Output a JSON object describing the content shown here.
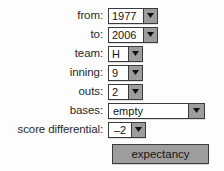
{
  "form": {
    "rows": [
      {
        "label": "from:",
        "name": "from",
        "value": "1977",
        "widget": "select",
        "arrow_icon": "chevron-down-icon"
      },
      {
        "label": "to:",
        "name": "to",
        "value": "2006",
        "widget": "select",
        "arrow_icon": "chevron-down-icon"
      },
      {
        "label": "team:",
        "name": "team",
        "value": "H",
        "widget": "select",
        "arrow_icon": "chevron-down-icon"
      },
      {
        "label": "inning:",
        "name": "inning",
        "value": "9",
        "widget": "select",
        "arrow_icon": "chevron-down-icon"
      },
      {
        "label": "outs:",
        "name": "outs",
        "value": "2",
        "widget": "select",
        "arrow_icon": "chevron-down-icon"
      },
      {
        "label": "bases:",
        "name": "bases",
        "value": "empty",
        "widget": "select",
        "arrow_icon": "chevron-down-icon"
      },
      {
        "label": "score differential:",
        "name": "score-differential",
        "value": "–2",
        "widget": "select",
        "arrow_icon": "chevron-down-icon"
      }
    ],
    "submit_button": {
      "label": "expectancy"
    }
  },
  "colors": {
    "page_background": "#fdfdfd",
    "control_face": "#9d9d9d",
    "control_border": "#3b3b3b",
    "field_background": "#ffffff",
    "text": "#2a2a2a"
  }
}
